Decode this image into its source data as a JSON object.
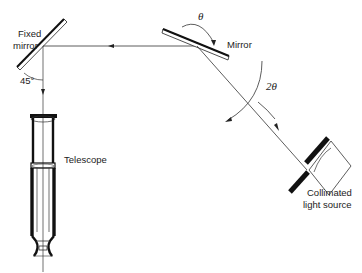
{
  "diagram": {
    "type": "optical-lever schematic",
    "labels": {
      "fixed_mirror_line1": "Fixed",
      "fixed_mirror_line2": "mirror",
      "angle_45": "45°",
      "mirror": "Mirror",
      "theta": "θ",
      "two_theta": "2θ",
      "telescope": "Telescope",
      "source_line1": "Collimated",
      "source_line2": "light source"
    },
    "components": [
      {
        "id": "fixed-mirror",
        "label": "Fixed mirror",
        "angle_deg": 45
      },
      {
        "id": "rotating-mirror",
        "label": "Mirror",
        "rotation": "θ"
      },
      {
        "id": "telescope",
        "label": "Telescope"
      },
      {
        "id": "light-source",
        "label": "Collimated light source"
      }
    ],
    "beam_deflection": "2θ",
    "colors": {
      "line": "#333333",
      "ink": "#111111",
      "background": "#ffffff"
    }
  }
}
